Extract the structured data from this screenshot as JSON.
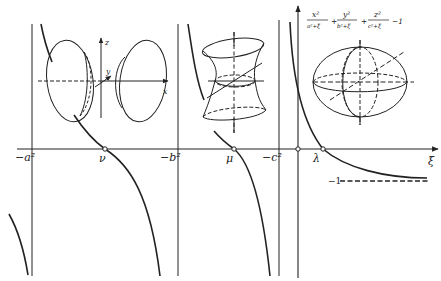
{
  "figure": {
    "colors": {
      "ink": "#222222",
      "background": "#ffffff"
    }
  },
  "axes": {
    "xi_axis_label": "ξ",
    "asymptotes": [
      {
        "label": "−a²",
        "x": 32
      },
      {
        "label": "−b²",
        "x": 178
      },
      {
        "label": "−c²",
        "x": 279
      }
    ],
    "roots": [
      {
        "label": "ν",
        "x": 105
      },
      {
        "label": "μ",
        "x": 234
      },
      {
        "label": "λ",
        "x": 323
      }
    ],
    "horizontal_asymptote_label": "−1"
  },
  "formula": {
    "num1": "x²",
    "den1": "a²+ξ",
    "num2": "y²",
    "den2": "b²+ξ",
    "num3": "z²",
    "den3": "c²+ξ",
    "plus": "+",
    "minus_one": "−1"
  },
  "inset_hyperboloid_two_sheets": {
    "axis_labels": {
      "x": "x",
      "y": "y",
      "z": "z"
    }
  },
  "inset_hyperboloid_one_sheet": {},
  "inset_ellipsoid": {}
}
